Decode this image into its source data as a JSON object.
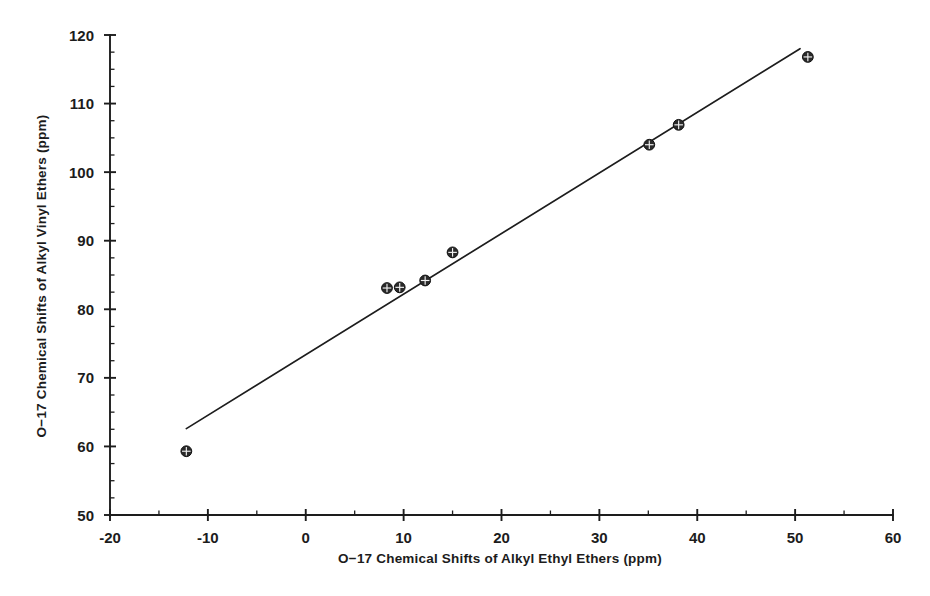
{
  "chart_data": {
    "type": "scatter",
    "title": "",
    "xlabel": "O−17 Chemical Shifts of Alkyl Ethyl Ethers (ppm)",
    "ylabel": "O−17 Chemical Shifts of Alkyl Vinyl Ethers (ppm)",
    "xlim": [
      -20,
      60
    ],
    "ylim": [
      50,
      120
    ],
    "xticks": [
      -20,
      -10,
      0,
      10,
      20,
      30,
      40,
      50,
      60
    ],
    "xtick_labels": [
      "-20",
      "-10",
      "0",
      "10",
      "20",
      "30",
      "40",
      "50",
      "60"
    ],
    "yticks": [
      50,
      60,
      70,
      80,
      90,
      100,
      110,
      120
    ],
    "ytick_labels": [
      "50",
      "60",
      "70",
      "80",
      "90",
      "100",
      "110",
      "120"
    ],
    "x_minor_tick_step": 5,
    "y_minor_tick_step": 2.5,
    "grid": false,
    "legend": null,
    "marker": "circled-plus",
    "marker_color": "#2a2a2a",
    "line_color": "#1d1d1d",
    "points": [
      {
        "x": -12.2,
        "y": 59.3
      },
      {
        "x": 8.3,
        "y": 83.1
      },
      {
        "x": 9.6,
        "y": 83.2
      },
      {
        "x": 12.2,
        "y": 84.2
      },
      {
        "x": 15.0,
        "y": 88.3
      },
      {
        "x": 35.1,
        "y": 104.0
      },
      {
        "x": 38.1,
        "y": 106.9
      },
      {
        "x": 51.3,
        "y": 116.8
      }
    ],
    "fit_line": {
      "x_start": -12.2,
      "y_start": 62.6,
      "x_end": 50.5,
      "y_end": 118.0
    }
  }
}
